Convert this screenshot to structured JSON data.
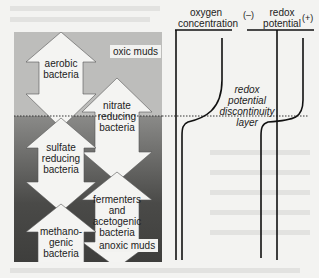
{
  "headers": {
    "oxygen": [
      "oxygen",
      "concentration"
    ],
    "redox": [
      "redox",
      "potential"
    ],
    "minus": "(–)",
    "plus": "(+)"
  },
  "zones": {
    "oxic": "oxic muds",
    "anoxic": "anoxic muds"
  },
  "bacteria": [
    {
      "lines": [
        "aerobic",
        "bacteria"
      ]
    },
    {
      "lines": [
        "nitrate",
        "reducing",
        "bacteria"
      ]
    },
    {
      "lines": [
        "sulfate",
        "reducing",
        "bacteria"
      ]
    },
    {
      "lines": [
        "fermenters",
        "and",
        "acetogenic",
        "bacteria"
      ]
    },
    {
      "lines": [
        "methano-",
        "genic",
        "bacteria"
      ]
    }
  ],
  "rpd_label": [
    "redox",
    "potential",
    "discontinuity",
    "layer"
  ],
  "colors": {
    "oxic": "#bdbdbb",
    "anoxic": "#4a4a48",
    "arrow": "#f4f4f2",
    "line": "#111111"
  }
}
